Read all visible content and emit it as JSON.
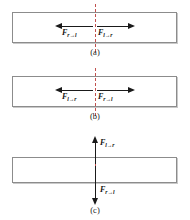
{
  "figure": {
    "colors": {
      "bar_border": "#8c8c8c",
      "bar_fill": "#ffffff",
      "bar_shadow": "#c9c9c9",
      "arrow": "#1a1a1a",
      "cut_line": "#c0504d",
      "text": "#111111"
    },
    "panels": [
      {
        "id": "a",
        "caption": "(a)",
        "orientation": "horizontal",
        "forces": [
          {
            "name": "force-right-on-left",
            "symbol": "F",
            "subscript": "r→l",
            "direction": "left",
            "position": "left-of-cut"
          },
          {
            "name": "force-left-on-right",
            "symbol": "F",
            "subscript": "l→r",
            "direction": "right",
            "position": "right-of-cut"
          }
        ]
      },
      {
        "id": "b",
        "caption": "(b)",
        "orientation": "horizontal",
        "forces": [
          {
            "name": "force-left-on-right",
            "symbol": "F",
            "subscript": "l→r",
            "direction": "left",
            "position": "left-of-cut"
          },
          {
            "name": "force-right-on-left",
            "symbol": "F",
            "subscript": "r→l",
            "direction": "right",
            "position": "right-of-cut"
          }
        ]
      },
      {
        "id": "c",
        "caption": "(c)",
        "orientation": "vertical",
        "forces": [
          {
            "name": "force-left-on-right",
            "symbol": "F",
            "subscript": "l→r",
            "direction": "up",
            "position": "above-bar"
          },
          {
            "name": "force-right-on-left",
            "symbol": "F",
            "subscript": "r→l",
            "direction": "down",
            "position": "below-bar"
          }
        ]
      }
    ]
  }
}
